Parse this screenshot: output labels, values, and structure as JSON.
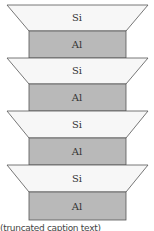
{
  "diagram": {
    "layers": [
      {
        "type": "trapezoid",
        "label": "Si",
        "y": 5
      },
      {
        "type": "rect",
        "label": "Al",
        "y": 31
      },
      {
        "type": "trapezoid",
        "label": "Si",
        "y": 58
      },
      {
        "type": "rect",
        "label": "Al",
        "y": 84
      },
      {
        "type": "trapezoid",
        "label": "Si",
        "y": 111
      },
      {
        "type": "rect",
        "label": "Al",
        "y": 138
      },
      {
        "type": "trapezoid",
        "label": "Si",
        "y": 165
      },
      {
        "type": "rect",
        "label": "Al",
        "y": 192
      }
    ],
    "colors": {
      "si_fill": "#f7f7f7",
      "al_fill": "#b9b9b9",
      "stroke": "#555555"
    },
    "caption": "(truncated caption text)"
  },
  "labels": {
    "si1": "Si",
    "al1": "Al",
    "si2": "Si",
    "al2": "Al",
    "si3": "Si",
    "al3": "Al",
    "si4": "Si",
    "al4": "Al"
  }
}
